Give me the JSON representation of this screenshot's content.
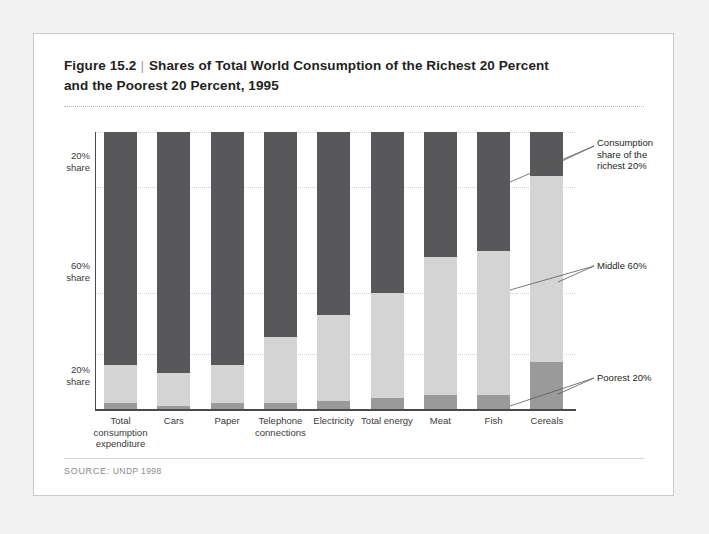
{
  "figure": {
    "number": "Figure 15.2",
    "separator": "|",
    "title_line1": "Shares of Total World Consumption of the Richest 20 Percent",
    "title_line2": "and the Poorest 20 Percent, 1995"
  },
  "source": {
    "label": "SOURCE:",
    "text": "UNDP 1998"
  },
  "axis": {
    "y_labels": [
      {
        "line1": "20%",
        "line2": "share"
      },
      {
        "line1": "60%",
        "line2": "share"
      },
      {
        "line1": "20%",
        "line2": "share"
      }
    ]
  },
  "callouts": {
    "richest": "Consumption share of the richest 20%",
    "richest_l1": "Consumption",
    "richest_l2": "share of the",
    "richest_l3": "richest 20%",
    "middle": "Middle 60%",
    "poorest": "Poorest 20%"
  },
  "colors": {
    "richest": "#58585a",
    "middle": "#d4d4d4",
    "poorest": "#9a9a9a",
    "gridline": "#c6d7e4",
    "axis": "#4a4a4a",
    "card_border": "#c9c9c9",
    "page_background": "#f2f2f2"
  },
  "chart_data": {
    "type": "bar",
    "title": "Shares of Total World Consumption of the Richest 20 Percent and the Poorest 20 Percent, 1995",
    "subtitle": "",
    "xlabel": "",
    "ylabel": "Share of total world consumption (%)",
    "ylim": [
      0,
      100
    ],
    "grid": true,
    "stacked": true,
    "legend": "annotations at right (Consumption share of the richest 20%, Middle 60%, Poorest 20%)",
    "categories": [
      "Total consumption expenditure",
      "Cars",
      "Paper",
      "Telephone connections",
      "Electricity",
      "Total energy",
      "Meat",
      "Fish",
      "Cereals"
    ],
    "category_label_lines": [
      [
        "Total",
        "consumption",
        "expenditure"
      ],
      [
        "Cars"
      ],
      [
        "Paper"
      ],
      [
        "Telephone",
        "connections"
      ],
      [
        "Electricity"
      ],
      [
        "Total energy"
      ],
      [
        "Meat"
      ],
      [
        "Fish"
      ],
      [
        "Cereals"
      ]
    ],
    "series": [
      {
        "name": "Consumption share of the richest 20%",
        "color": "#58585a",
        "values": [
          84,
          87,
          84,
          74,
          66,
          58,
          45,
          43,
          16
        ]
      },
      {
        "name": "Middle 60%",
        "color": "#d4d4d4",
        "values": [
          14,
          12,
          14,
          24,
          31,
          38,
          50,
          52,
          67
        ]
      },
      {
        "name": "Poorest 20%",
        "color": "#9a9a9a",
        "values": [
          2,
          1,
          2,
          2,
          3,
          4,
          5,
          5,
          17
        ]
      }
    ],
    "y_tick_labels": [
      "20% share",
      "60% share",
      "20% share"
    ],
    "y_tick_values": [
      90,
      50,
      10
    ],
    "gridline_values": [
      100,
      80,
      42,
      20
    ]
  }
}
